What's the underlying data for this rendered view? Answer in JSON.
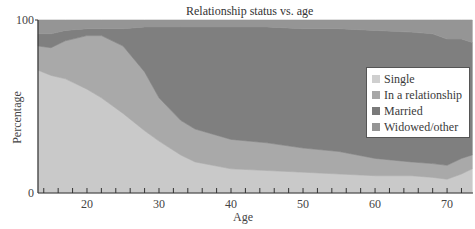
{
  "chart_data": {
    "type": "area",
    "stacked": true,
    "title": "Relationship status vs. age",
    "xlabel": "Age",
    "ylabel": "Percentage",
    "xlim": [
      13.2,
      73.6
    ],
    "ylim": [
      0,
      100
    ],
    "x_ticks": [
      20,
      30,
      40,
      50,
      60,
      70
    ],
    "y_ticks": [
      0,
      100
    ],
    "grid": false,
    "legend_position": "right-inside",
    "x": [
      13,
      15,
      17,
      20,
      22,
      25,
      28,
      30,
      33,
      35,
      40,
      45,
      50,
      55,
      60,
      65,
      68,
      70,
      72,
      73.5
    ],
    "series": [
      {
        "name": "Single",
        "color": "#c9c9c9",
        "values": [
          71,
          68,
          66,
          60,
          55,
          46,
          36,
          30,
          22,
          18,
          14,
          13,
          12,
          11,
          10,
          10,
          9,
          8,
          11,
          14
        ]
      },
      {
        "name": "In a relationship",
        "color": "#a9a9a9",
        "values": [
          14,
          16,
          22,
          31,
          36,
          39,
          34,
          25,
          20,
          19,
          17,
          16,
          14,
          13,
          10,
          8,
          8,
          8,
          9,
          8
        ]
      },
      {
        "name": "Married",
        "color": "#7f7f7f",
        "values": [
          7,
          8,
          6,
          4,
          4,
          10,
          26,
          41,
          54,
          59,
          65,
          67,
          69,
          71,
          74,
          75,
          75,
          73,
          69,
          65
        ]
      },
      {
        "name": "Widowed/other",
        "color": "#959595",
        "values": [
          8,
          8,
          6,
          5,
          5,
          5,
          4,
          4,
          4,
          4,
          4,
          4,
          5,
          5,
          6,
          7,
          8,
          11,
          11,
          13
        ]
      }
    ]
  },
  "legend": {
    "items": [
      {
        "label": "Single",
        "color": "#cfcfcf"
      },
      {
        "label": "In a relationship",
        "color": "#a7a7a7"
      },
      {
        "label": "Married",
        "color": "#7a7a7a"
      },
      {
        "label": "Widowed/other",
        "color": "#959595"
      }
    ]
  },
  "axis": {
    "y_top_label": "100",
    "y_bottom_label": "0"
  }
}
